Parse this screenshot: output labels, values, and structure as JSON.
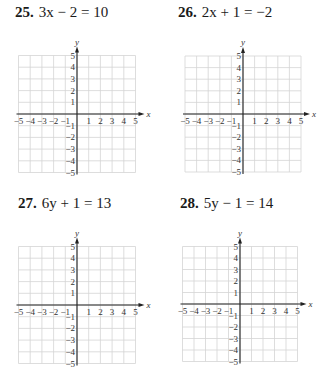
{
  "problems": [
    {
      "number": "25.",
      "equation": "3x − 2 = 10",
      "variable": "x",
      "x_label": "x",
      "y_label": "y",
      "x_ticks": [
        "−5",
        "−4",
        "−3",
        "−2",
        "−1",
        "1",
        "2",
        "3",
        "4",
        "5"
      ],
      "y_ticks": [
        "5",
        "4",
        "3",
        "2",
        "1",
        "−1",
        "−2",
        "−3",
        "−4",
        "−5"
      ]
    },
    {
      "number": "26.",
      "equation": "2x + 1 = −2",
      "variable": "x",
      "x_label": "x",
      "y_label": "y",
      "x_ticks": [
        "−5",
        "−4",
        "−3",
        "−2",
        "−1",
        "1",
        "2",
        "3",
        "4",
        "5"
      ],
      "y_ticks": [
        "5",
        "4",
        "3",
        "2",
        "1",
        "−1",
        "−2",
        "−3",
        "−4",
        "−5"
      ]
    },
    {
      "number": "27.",
      "equation": "6y + 1 = 13",
      "variable": "y",
      "x_label": "x",
      "y_label": "y",
      "x_ticks": [
        "−5",
        "−4",
        "−3",
        "−2",
        "−1",
        "1",
        "2",
        "3",
        "4",
        "5"
      ],
      "y_ticks": [
        "5",
        "4",
        "3",
        "2",
        "1",
        "−1",
        "−2",
        "−3",
        "−4",
        "−5"
      ]
    },
    {
      "number": "28.",
      "equation": "5y − 1 = 14",
      "variable": "y",
      "x_label": "x",
      "y_label": "y",
      "x_ticks": [
        "−5",
        "−4",
        "−3",
        "−2",
        "−1",
        "1",
        "2",
        "3",
        "4",
        "5"
      ],
      "y_ticks": [
        "5",
        "4",
        "3",
        "2",
        "1",
        "−1",
        "−2",
        "−3",
        "−4",
        "−5"
      ]
    }
  ],
  "chart_data": [
    {
      "type": "scatter",
      "title": "25. 3x − 2 = 10",
      "xlabel": "x",
      "ylabel": "y",
      "xlim": [
        -5,
        5
      ],
      "ylim": [
        -5,
        5
      ],
      "grid": true,
      "series": []
    },
    {
      "type": "scatter",
      "title": "26. 2x + 1 = −2",
      "xlabel": "x",
      "ylabel": "y",
      "xlim": [
        -5,
        5
      ],
      "ylim": [
        -5,
        5
      ],
      "grid": true,
      "series": []
    },
    {
      "type": "scatter",
      "title": "27. 6y + 1 = 13",
      "xlabel": "x",
      "ylabel": "y",
      "xlim": [
        -5,
        5
      ],
      "ylim": [
        -5,
        5
      ],
      "grid": true,
      "series": []
    },
    {
      "type": "scatter",
      "title": "28. 5y − 1 = 14",
      "xlabel": "x",
      "ylabel": "y",
      "xlim": [
        -5,
        5
      ],
      "ylim": [
        -5,
        5
      ],
      "grid": true,
      "series": []
    }
  ]
}
